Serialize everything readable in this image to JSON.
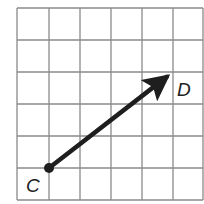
{
  "diagram": {
    "type": "grid-vector",
    "grid": {
      "columns": 6,
      "rows": 6,
      "x_lines": [
        17,
        49,
        80,
        111,
        142,
        173,
        203
      ],
      "y_lines": [
        8,
        40,
        72,
        104,
        136,
        168,
        200
      ],
      "line_color": "#8a8a8a"
    },
    "vector": {
      "start": {
        "label": "C",
        "grid": [
          1,
          5
        ],
        "px": [
          49,
          168
        ]
      },
      "end": {
        "label": "D",
        "grid": [
          5,
          2
        ],
        "px": [
          173,
          72
        ]
      },
      "color": "#1e1e1e"
    },
    "labels": {
      "start": "C",
      "end": "D"
    }
  }
}
